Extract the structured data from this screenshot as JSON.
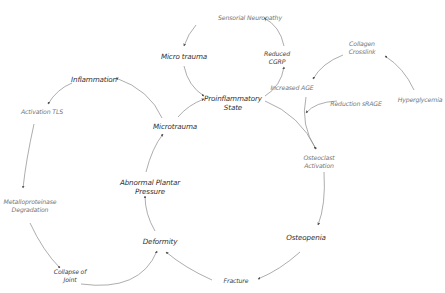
{
  "diagram": {
    "type": "cycle-flow",
    "nodes": [
      {
        "id": "sensorial-neuropathy",
        "label": "Sensorial Neuropathy",
        "x": 250,
        "y": 18
      },
      {
        "id": "micro-trauma-top",
        "label": "Micro trauma",
        "x": 184,
        "y": 56
      },
      {
        "id": "reduced-cgrp",
        "lines": [
          "Reduced",
          "CGRP"
        ],
        "x": 277,
        "y": 58
      },
      {
        "id": "collagen-crosslink",
        "lines": [
          "Collagen",
          "Crosslink"
        ],
        "x": 362,
        "y": 48
      },
      {
        "id": "hyperglycemia",
        "label": "Hyperglycemia",
        "x": 420,
        "y": 100
      },
      {
        "id": "increased-age",
        "label": "Increased AGE",
        "x": 292,
        "y": 88
      },
      {
        "id": "reduction-srage",
        "label": "Reduction sRAGE",
        "x": 356,
        "y": 104
      },
      {
        "id": "proinflammatory-state",
        "lines": [
          "Proinflammatory",
          "State"
        ],
        "x": 233,
        "y": 103
      },
      {
        "id": "inflammation",
        "label": "Inflammation",
        "x": 94,
        "y": 79
      },
      {
        "id": "activation-tls",
        "label": "Activation TLS",
        "x": 42,
        "y": 112
      },
      {
        "id": "microtrauma",
        "label": "Microtrauma",
        "x": 175,
        "y": 126
      },
      {
        "id": "osteoclast-activation",
        "lines": [
          "Osteoclast",
          "Activation"
        ],
        "x": 319,
        "y": 162
      },
      {
        "id": "abnormal-plantar-pressure",
        "lines": [
          "Abnormal Plantar",
          "Pressure"
        ],
        "x": 150,
        "y": 187
      },
      {
        "id": "metalloproteinase-degradation",
        "lines": [
          "Metalloproteinase",
          "Degradation"
        ],
        "x": 30,
        "y": 206
      },
      {
        "id": "osteopenia",
        "label": "Osteopenia",
        "x": 306,
        "y": 237
      },
      {
        "id": "deformity",
        "label": "Deformity",
        "x": 160,
        "y": 241
      },
      {
        "id": "collapse-of-joint",
        "lines": [
          "Collapse of",
          "Joint"
        ],
        "x": 70,
        "y": 276
      },
      {
        "id": "fracture",
        "label": "Fracture",
        "x": 236,
        "y": 281
      }
    ],
    "edges": [
      {
        "from": "sensorial-neuropathy",
        "to": "micro-trauma-top",
        "path": "M 196 25 Q 188 34 184 46"
      },
      {
        "from": "micro-trauma-top",
        "to": "proinflammatory-state",
        "path": "M 184 66 Q 188 86 204 96"
      },
      {
        "from": "proinflammatory-state",
        "to": "reduced-cgrp",
        "path": "M 265 96 Q 281 86 284 67"
      },
      {
        "from": "reduced-cgrp",
        "to": "sensorial-neuropathy",
        "path": "M 284 46 Q 280 26 264 18"
      },
      {
        "from": "hyperglycemia",
        "to": "collagen-crosslink",
        "path": "M 414 90 Q 404 68 385 56"
      },
      {
        "from": "collagen-crosslink",
        "to": "increased-age",
        "path": "M 343 55 Q 322 63 313 79"
      },
      {
        "from": "increased-age",
        "to": "osteoclast-activation",
        "path": "M 306 97 Q 300 125 316 149"
      },
      {
        "from": "reduction-srage",
        "to": "increased-age-line",
        "path": "M 337 101 Q 315 102 306 113"
      },
      {
        "from": "proinflammatory-state",
        "to": "osteoclast-activation",
        "path": "M 265 101 Q 300 115 316 149"
      },
      {
        "from": "microtrauma",
        "to": "proinflammatory-state",
        "path": "M 178 117 Q 188 105 204 99"
      },
      {
        "from": "microtrauma",
        "to": "inflammation",
        "path": "M 162 118 Q 150 90 116 78"
      },
      {
        "from": "inflammation",
        "to": "activation-tls",
        "path": "M 72 83 Q 57 89 48 104"
      },
      {
        "from": "activation-tls",
        "to": "metalloproteinase-degradation",
        "path": "M 34 124 Q 26 160 23 188"
      },
      {
        "from": "metalloproteinase-degradation",
        "to": "collapse-of-joint",
        "path": "M 30 223 Q 43 251 60 268"
      },
      {
        "from": "collapse-of-joint",
        "to": "deformity",
        "path": "M 81 284 Q 140 292 157 251"
      },
      {
        "from": "fracture",
        "to": "deformity",
        "path": "M 212 280 Q 185 268 166 252"
      },
      {
        "from": "osteopenia",
        "to": "fracture",
        "path": "M 300 252 Q 280 270 258 279"
      },
      {
        "from": "osteoclast-activation",
        "to": "osteopenia",
        "path": "M 324 172 Q 326 205 318 225"
      },
      {
        "from": "deformity",
        "to": "abnormal-plantar-pressure",
        "path": "M 155 231 Q 145 214 145 196"
      },
      {
        "from": "abnormal-plantar-pressure",
        "to": "microtrauma",
        "path": "M 146 172 Q 152 148 163 134"
      }
    ],
    "colors": {
      "edge": "#8a8a8a",
      "arrowhead": "#555555",
      "text": "#444444",
      "background": "#ffffff"
    }
  }
}
